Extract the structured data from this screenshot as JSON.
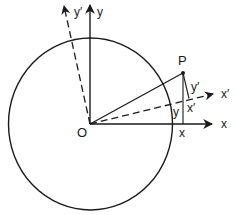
{
  "diagram": {
    "colors": {
      "stroke": "#1a1a1a",
      "background": "#ffffff"
    },
    "origin_label": "O",
    "point_label": "P",
    "axes": {
      "x": "x",
      "y": "y",
      "x_prime": "x′",
      "y_prime": "y′"
    },
    "components": {
      "x_proj": "x",
      "y_proj": "y",
      "x_prime_proj": "x′",
      "y_prime_proj": "y′"
    }
  }
}
